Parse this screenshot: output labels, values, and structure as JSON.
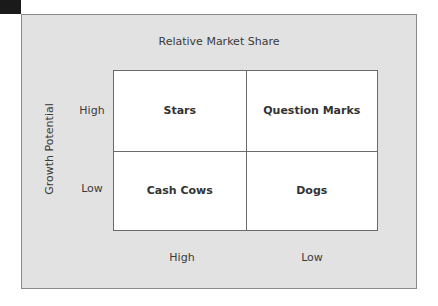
{
  "diagram": {
    "type": "2x2 matrix",
    "x_axis": {
      "title": "Relative Market Share",
      "labels": [
        "High",
        "Low"
      ]
    },
    "y_axis": {
      "title": "Growth Potential",
      "labels": [
        "High",
        "Low"
      ]
    },
    "quadrants": [
      {
        "label": "Stars",
        "x": "High",
        "y": "High"
      },
      {
        "label": "Question Marks",
        "x": "Low",
        "y": "High"
      },
      {
        "label": "Cash Cows",
        "x": "High",
        "y": "Low"
      },
      {
        "label": "Dogs",
        "x": "Low",
        "y": "Low"
      }
    ],
    "colors": {
      "panel_background": "#e2e2e2",
      "grid_background": "#ffffff",
      "border": "#6a6a6a",
      "text": "#333333"
    }
  }
}
